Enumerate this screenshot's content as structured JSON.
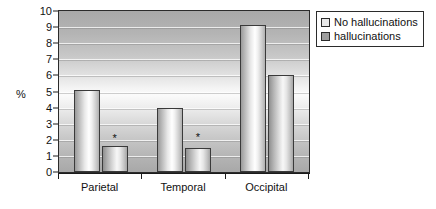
{
  "chart_data": {
    "type": "bar",
    "title": "",
    "xlabel": "",
    "ylabel": "%",
    "ylim": [
      0,
      10
    ],
    "ytick_step": 1,
    "yticks": [
      0,
      1,
      2,
      3,
      4,
      5,
      6,
      7,
      8,
      9,
      10
    ],
    "grid": true,
    "legend_position": "right",
    "categories": [
      "Parietal",
      "Temporal",
      "Occipital"
    ],
    "series": [
      {
        "name": "No hallucinations",
        "values": [
          5.1,
          4.0,
          9.15
        ],
        "color": "#e9e9e9"
      },
      {
        "name": "hallucinations",
        "values": [
          1.6,
          1.5,
          6.0
        ],
        "color": "#9e9e9e"
      }
    ],
    "annotations": [
      {
        "text": "*",
        "category": "Parietal",
        "series": "hallucinations",
        "y": 2.4
      },
      {
        "text": "*",
        "category": "Temporal",
        "series": "hallucinations",
        "y": 2.5
      }
    ]
  },
  "legend": {
    "items": [
      {
        "label": "No hallucinations"
      },
      {
        "label": "hallucinations"
      }
    ]
  },
  "axis": {
    "y_label": "%",
    "y_ticks": [
      "10",
      "9",
      "8",
      "7",
      "6",
      "5",
      "4",
      "3",
      "2",
      "1",
      "0"
    ],
    "x_labels": [
      "Parietal",
      "Temporal",
      "Occipital"
    ]
  }
}
